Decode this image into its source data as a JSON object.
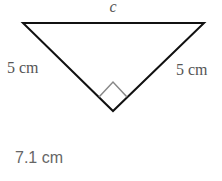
{
  "diagram": {
    "shape": "right isosceles triangle",
    "hypotenuse_label": "c",
    "left_leg_label": "5 cm",
    "right_leg_label": "5 cm",
    "right_angle_marker": true,
    "colors": {
      "lines": "#111111",
      "marker": "#888888",
      "labels": "#555555"
    }
  },
  "answer": {
    "text": "7.1 cm"
  }
}
